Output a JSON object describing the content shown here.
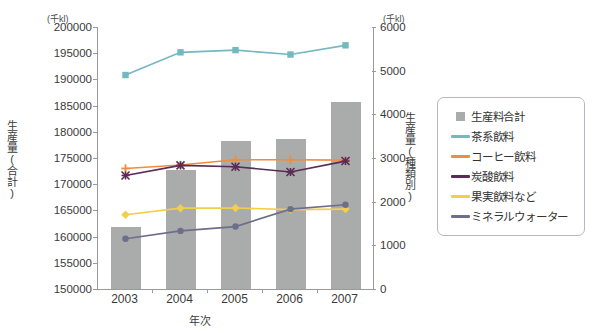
{
  "chart_data": {
    "type": "bar",
    "title": "",
    "subtitle": "",
    "xlabel": "年次",
    "ylabel": "生産量(合計)",
    "y2label": "生産量(種類別)",
    "unit_left": "(千kl)",
    "unit_right": "(千kl)",
    "categories": [
      "2003",
      "2004",
      "2005",
      "2006",
      "2007"
    ],
    "ylim": [
      150000,
      200000
    ],
    "yticks": [
      150000,
      155000,
      160000,
      165000,
      170000,
      175000,
      180000,
      185000,
      190000,
      195000,
      200000
    ],
    "y2lim": [
      0,
      6000
    ],
    "y2ticks": [
      0,
      1000,
      2000,
      3000,
      4000,
      5000,
      6000
    ],
    "grid": false,
    "legend_position": "right",
    "series": [
      {
        "name": "生産料合計",
        "type": "bar",
        "axis": "left",
        "color": "#a9acab",
        "marker": "none",
        "values": [
          161800,
          172800,
          178200,
          178600,
          185600
        ]
      },
      {
        "name": "茶系飲料",
        "type": "line",
        "axis": "right",
        "color": "#74b8c0",
        "marker": "square",
        "values": [
          4900,
          5420,
          5470,
          5370,
          5580
        ]
      },
      {
        "name": "コーヒー飲料",
        "type": "line",
        "axis": "right",
        "color": "#f08c3c",
        "marker": "plus",
        "values": [
          2760,
          2840,
          2960,
          2960,
          2950
        ]
      },
      {
        "name": "炭酸飲料",
        "type": "line",
        "axis": "right",
        "color": "#5b2a55",
        "marker": "star",
        "values": [
          2600,
          2830,
          2800,
          2680,
          2930
        ]
      },
      {
        "name": "果実飲料など",
        "type": "line",
        "axis": "right",
        "color": "#f2cf4a",
        "marker": "diamond",
        "values": [
          1700,
          1850,
          1855,
          1820,
          1830
        ]
      },
      {
        "name": "ミネラルウォーター",
        "type": "line",
        "axis": "right",
        "color": "#6d6e8b",
        "marker": "circle",
        "values": [
          1150,
          1330,
          1430,
          1830,
          1930
        ]
      }
    ]
  },
  "legend": {
    "items": [
      {
        "label": "生産料合計",
        "key": "box",
        "color": "#a9acab"
      },
      {
        "label": "茶系飲料",
        "key": "line",
        "color": "#74b8c0"
      },
      {
        "label": "コーヒー飲料",
        "key": "line",
        "color": "#f08c3c"
      },
      {
        "label": "炭酸飲料",
        "key": "line",
        "color": "#5b2a55"
      },
      {
        "label": "果実飲料など",
        "key": "line",
        "color": "#f2cf4a"
      },
      {
        "label": "ミネラルウォーター",
        "key": "line",
        "color": "#6d6e8b"
      }
    ]
  }
}
